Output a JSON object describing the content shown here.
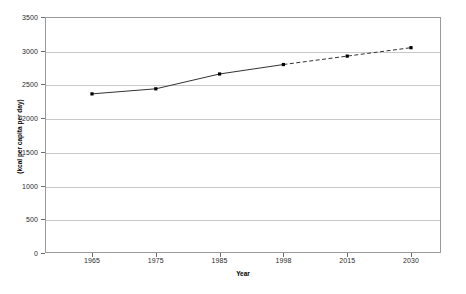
{
  "chart_data": {
    "type": "line",
    "title": "",
    "xlabel": "Year",
    "ylabel": "(kcal per capita per day)",
    "categories": [
      "1965",
      "1975",
      "1985",
      "1998",
      "2015",
      "2030"
    ],
    "x_tick_labels": [
      "1965",
      "1975",
      "1985",
      "1998",
      "2015",
      "2030"
    ],
    "y_tick_labels": [
      "0",
      "500",
      "1000",
      "1500",
      "2000",
      "2500",
      "3000",
      "3500"
    ],
    "y_tick_values": [
      0,
      500,
      1000,
      1500,
      2000,
      2500,
      3000,
      3500
    ],
    "ylim": [
      0,
      3500
    ],
    "grid": true,
    "legend": "none",
    "series": [
      {
        "name": "Food consumption (kcal per capita per day)",
        "values": [
          2360,
          2435,
          2655,
          2795,
          2920,
          3045
        ],
        "observed_values": [
          2360,
          2435,
          2655,
          2795
        ],
        "projected_values": [
          2795,
          2920,
          3045
        ],
        "observed_style": "solid",
        "projected_style": "dashed",
        "marker": "square",
        "color": "#333333"
      }
    ],
    "annotations": [
      "Solid line: historical values (1965-1998)",
      "Dashed line: projected values (1998-2030)"
    ]
  },
  "style": {
    "line_color": "#333333",
    "marker_color": "#000000",
    "grid_color": "#c8c8c8",
    "frame_color": "#9a9a9a",
    "background": "#ffffff"
  }
}
